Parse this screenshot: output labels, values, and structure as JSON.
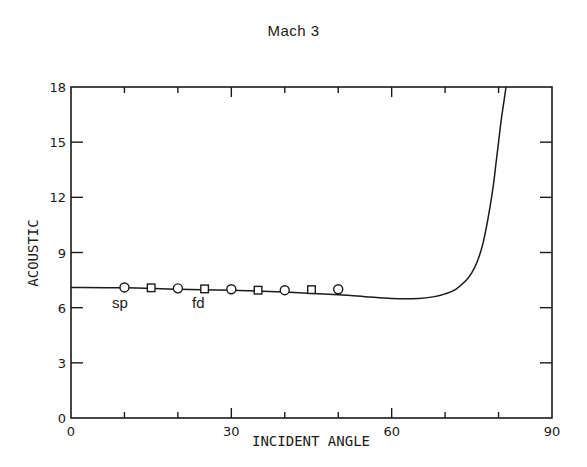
{
  "chart_data": {
    "type": "line",
    "title": "Mach  3",
    "xlabel": "INCIDENT ANGLE",
    "ylabel": "ACOUSTIC",
    "xlim": [
      0,
      90
    ],
    "ylim": [
      0,
      18
    ],
    "xticks": [
      0,
      30,
      60,
      90
    ],
    "yticks": [
      0,
      3,
      6,
      9,
      12,
      15,
      18
    ],
    "grid": false,
    "legend": null,
    "series": [
      {
        "name": "theory",
        "style": "line",
        "x": [
          0,
          10,
          20,
          30,
          40,
          50,
          55,
          60,
          65,
          68,
          70,
          72,
          74,
          75,
          76,
          77,
          78,
          79,
          79.5,
          80,
          80.5,
          81,
          81.4
        ],
        "y": [
          7.1,
          7.08,
          7.0,
          6.95,
          6.85,
          6.7,
          6.6,
          6.5,
          6.5,
          6.6,
          6.75,
          7.0,
          7.5,
          7.9,
          8.5,
          9.4,
          10.8,
          12.6,
          13.8,
          15.0,
          16.2,
          17.2,
          18.0
        ]
      },
      {
        "name": "sp",
        "style": "circle",
        "x": [
          10,
          20,
          30,
          40,
          50
        ],
        "y": [
          7.1,
          7.05,
          7.0,
          6.95,
          7.0
        ]
      },
      {
        "name": "fd",
        "style": "square",
        "x": [
          15,
          25,
          35,
          45
        ],
        "y": [
          7.08,
          7.02,
          6.95,
          6.98
        ]
      }
    ],
    "annotations": [
      {
        "text": "sp",
        "x": 10,
        "y": 6.2
      },
      {
        "text": "fd",
        "x": 25,
        "y": 6.2
      }
    ]
  },
  "labels": {
    "title": "Mach  3",
    "xlabel": "INCIDENT ANGLE",
    "ylabel": "ACOUSTIC",
    "annot_sp": "sp",
    "annot_fd": "fd"
  }
}
